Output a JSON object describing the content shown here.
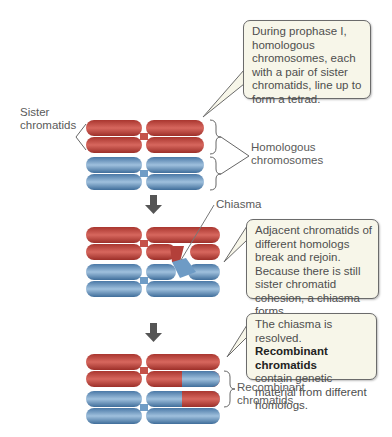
{
  "callouts": {
    "prophase": "During prophase I, homologous chromosomes, each with a pair of sister chromatids, line up to form a tetrad.",
    "chiasma_forms": "Adjacent chromatids of different homologs break and rejoin. Because there is still sister chromatid cohesion, a chiasma forms.",
    "resolved_pre": "The chiasma is resolved.",
    "resolved_bold": "Recombinant chromatids",
    "resolved_post": "contain genetic material from different homologs."
  },
  "labels": {
    "sister_1": "Sister",
    "sister_2": "chromatids",
    "homologous_1": "Homologous",
    "homologous_2": "chromosomes",
    "chiasma": "Chiasma",
    "recombinant_1": "Recombinant",
    "recombinant_2": "chromatids"
  },
  "colors": {
    "maternal_red": "#b8433b",
    "paternal_blue": "#5b8ab8",
    "callout_bg": "#f7f6e9",
    "arrow": "#555555"
  },
  "stages": [
    "tetrad",
    "chiasma",
    "recombinant"
  ]
}
